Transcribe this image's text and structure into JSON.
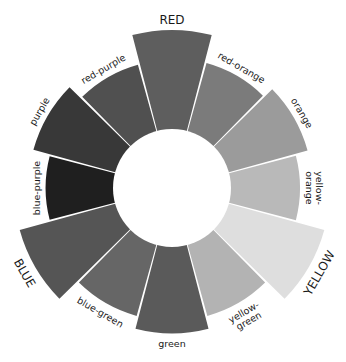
{
  "diagram": {
    "title": "",
    "type": "color-wheel",
    "start_angle_deg": -90,
    "direction": "clockwise",
    "inner_fill": "#ffffff",
    "segments": [
      {
        "id": "red",
        "label": [
          "RED"
        ],
        "primary": true,
        "color": "#5e5e5e",
        "relative_size": 1.0
      },
      {
        "id": "red-orange",
        "label": [
          "red-orange"
        ],
        "primary": false,
        "color": "#7b7b7b",
        "relative_size": 0.82
      },
      {
        "id": "orange",
        "label": [
          "orange"
        ],
        "primary": false,
        "color": "#9b9b9b",
        "relative_size": 0.89
      },
      {
        "id": "yellow-orange",
        "label": [
          "yellow-",
          "orange"
        ],
        "primary": false,
        "color": "#b9b9b9",
        "relative_size": 0.81
      },
      {
        "id": "yellow",
        "label": [
          "YELLOW"
        ],
        "primary": true,
        "color": "#dedede",
        "relative_size": 1.0
      },
      {
        "id": "yellow-green",
        "label": [
          "yellow-",
          "green"
        ],
        "primary": false,
        "color": "#b3b3b3",
        "relative_size": 0.84
      },
      {
        "id": "green",
        "label": [
          "green"
        ],
        "primary": false,
        "color": "#5a5a5a",
        "relative_size": 0.92
      },
      {
        "id": "blue-green",
        "label": [
          "blue-green"
        ],
        "primary": false,
        "color": "#666666",
        "relative_size": 0.84
      },
      {
        "id": "blue",
        "label": [
          "BLUE"
        ],
        "primary": true,
        "color": "#555555",
        "relative_size": 1.0
      },
      {
        "id": "blue-purple",
        "label": [
          "blue-purple"
        ],
        "primary": false,
        "color": "#1f1f1f",
        "relative_size": 0.8
      },
      {
        "id": "purple",
        "label": [
          "purple"
        ],
        "primary": false,
        "color": "#383838",
        "relative_size": 0.91
      },
      {
        "id": "red-purple",
        "label": [
          "red-purple"
        ],
        "primary": false,
        "color": "#505050",
        "relative_size": 0.81
      }
    ]
  }
}
